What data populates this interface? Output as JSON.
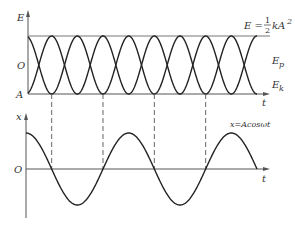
{
  "top_graph": {
    "y_axis_label": "E",
    "y_tick_labels": {
      "top": "",
      "middle": "O",
      "bottom": "A"
    },
    "x_axis_label": "t",
    "total_energy_label": {
      "lhs": "E = ",
      "num": "1",
      "den": "2",
      "rhs": "kA",
      "exp": "2"
    },
    "potential_label": {
      "base": "E",
      "sub": "p"
    },
    "kinetic_label": {
      "base": "E",
      "sub": "k"
    }
  },
  "bottom_graph": {
    "y_axis_label": "x",
    "origin_label": "O",
    "x_axis_label": "t",
    "equation_label": "x=Acosωt"
  },
  "colors": {
    "line": "#222222",
    "axis": "#555555",
    "dashed": "#555555",
    "text": "#333333"
  },
  "chart_data": {
    "type": "line",
    "panels": [
      {
        "title": "Energy vs time",
        "ylabel": "E",
        "xlabel": "t",
        "series": [
          {
            "name": "E_p",
            "formula": "½kA²cos²(ωt)",
            "start": "max"
          },
          {
            "name": "E_k",
            "formula": "½kA²sin²(ωt)",
            "start": "min"
          },
          {
            "name": "E",
            "formula": "½kA² (constant)"
          }
        ],
        "periods_shown_of_x": 2.25
      },
      {
        "title": "Displacement vs time",
        "ylabel": "x",
        "xlabel": "t",
        "series": [
          {
            "name": "x",
            "formula": "Acos(ωt)"
          }
        ],
        "periods_shown": 2.25
      }
    ]
  }
}
